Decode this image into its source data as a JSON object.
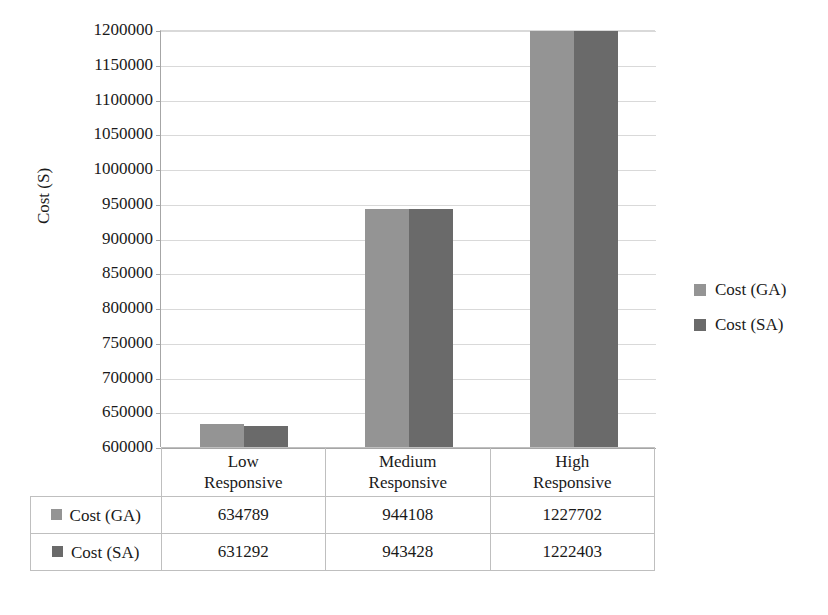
{
  "chart_data": {
    "type": "bar",
    "title": "",
    "xlabel": "",
    "ylabel": "Cost (S)",
    "ylim": [
      600000,
      1200000
    ],
    "ytick_step": 50000,
    "yticks": [
      "1200000",
      "1150000",
      "1100000",
      "1050000",
      "1000000",
      "950000",
      "900000",
      "850000",
      "800000",
      "750000",
      "700000",
      "650000",
      "600000"
    ],
    "categories": [
      "Low Responsive",
      "Medium Responsive",
      "High Responsive"
    ],
    "category_lines": [
      [
        "Low",
        "Responsive"
      ],
      [
        "Medium",
        "Responsive"
      ],
      [
        "High",
        "Responsive"
      ]
    ],
    "grid": true,
    "legend_position": "right",
    "series": [
      {
        "name": "Cost (GA)",
        "color": "#949494",
        "values": [
          634789,
          944108,
          1227702
        ]
      },
      {
        "name": "Cost (SA)",
        "color": "#6a6a6a",
        "values": [
          631292,
          943428,
          1222403
        ]
      }
    ],
    "value_labels": [
      [
        "634789",
        "944108",
        "1227702"
      ],
      [
        "631292",
        "943428",
        "1222403"
      ]
    ]
  },
  "legend": {
    "items": [
      {
        "label": "Cost (GA)",
        "color": "#949494"
      },
      {
        "label": "Cost (SA)",
        "color": "#6a6a6a"
      }
    ]
  },
  "table": {
    "corner": "",
    "columns": [
      "Low Responsive",
      "Medium Responsive",
      "High Responsive"
    ],
    "rows": [
      {
        "label": "Cost (GA)",
        "color": "#949494",
        "values": [
          "634789",
          "944108",
          "1227702"
        ]
      },
      {
        "label": "Cost (SA)",
        "color": "#6a6a6a",
        "values": [
          "631292",
          "943428",
          "1222403"
        ]
      }
    ]
  },
  "colors": {
    "series_ga": "#949494",
    "series_sa": "#6a6a6a",
    "gridline": "#d9d9d9",
    "axis": "#a6a6a6",
    "table_border": "#bfbfbf",
    "background": "#ffffff"
  }
}
